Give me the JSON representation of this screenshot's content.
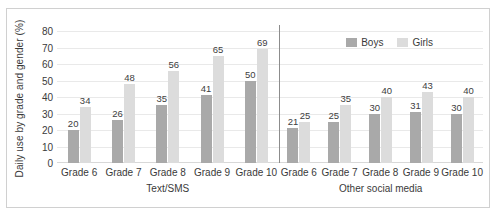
{
  "chart_data": {
    "type": "bar",
    "title": "",
    "xlabel": "",
    "ylabel": "Daily use by grade and gender (%)",
    "ylim": [
      0,
      80
    ],
    "ytick_step": 10,
    "yticks": [
      80,
      70,
      60,
      50,
      40,
      30,
      20,
      10,
      0
    ],
    "grid": true,
    "legend_position": "top-right-panel",
    "categories": [
      "Grade 6",
      "Grade 7",
      "Grade 8",
      "Grade 9",
      "Grade 10"
    ],
    "series": [
      {
        "name": "Boys",
        "color": "#a9a9a9"
      },
      {
        "name": "Girls",
        "color": "#dcdcdc"
      }
    ],
    "panels": [
      {
        "name": "Text/SMS",
        "series": [
          {
            "name": "Boys",
            "values": [
              20,
              26,
              35,
              41,
              50
            ]
          },
          {
            "name": "Girls",
            "values": [
              34,
              48,
              56,
              65,
              69
            ]
          }
        ]
      },
      {
        "name": "Other social media",
        "series": [
          {
            "name": "Boys",
            "values": [
              21,
              25,
              30,
              31,
              30
            ]
          },
          {
            "name": "Girls",
            "values": [
              25,
              35,
              40,
              43,
              40
            ]
          }
        ]
      }
    ]
  },
  "colors": {
    "boys": "#a9a9a9",
    "girls": "#dcdcdc",
    "grid": "#e9e9e9",
    "divider": "#8c8c8c",
    "border": "#d0d0d0",
    "text": "#3a3a3a"
  }
}
